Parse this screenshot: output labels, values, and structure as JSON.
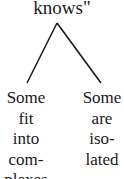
{
  "root": {
    "label": "knows\""
  },
  "branches": [
    {
      "lines": [
        "Some",
        "fit",
        "into",
        "com-",
        "plexes"
      ]
    },
    {
      "lines": [
        "Some",
        "are",
        "iso-",
        "lated"
      ]
    }
  ],
  "colors": {
    "line": "#1a1a1a",
    "text": "#1a1a1a",
    "background": "#ffffff"
  }
}
